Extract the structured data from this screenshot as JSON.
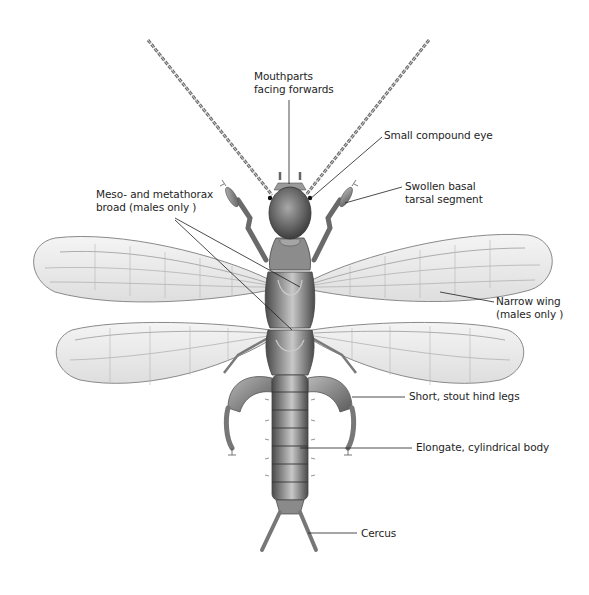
{
  "figure": {
    "background": "#ffffff",
    "ink_color": "#1e1e1e",
    "body_color": "#7a7a7a",
    "wing_color": "#ececec"
  },
  "labels": [
    {
      "id": "mouthparts",
      "lines": [
        "Mouthparts",
        "facing forwards"
      ]
    },
    {
      "id": "compound-eye",
      "lines": [
        "Small compound eye"
      ]
    },
    {
      "id": "tarsal-segment",
      "lines": [
        "Swollen basal",
        "tarsal segment"
      ]
    },
    {
      "id": "thorax",
      "lines": [
        "Meso- and metathorax",
        "broad (males only )"
      ]
    },
    {
      "id": "narrow-wing",
      "lines": [
        "Narrow wing",
        "(males only )"
      ]
    },
    {
      "id": "hind-legs",
      "lines": [
        "Short, stout hind legs"
      ]
    },
    {
      "id": "body",
      "lines": [
        "Elongate, cylindrical body"
      ]
    },
    {
      "id": "cercus",
      "lines": [
        "Cercus"
      ]
    }
  ]
}
